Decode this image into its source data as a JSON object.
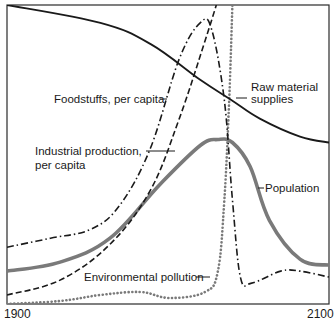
{
  "chart_data": {
    "type": "line",
    "title": "",
    "xlabel": "",
    "ylabel": "",
    "xlim": [
      1900,
      2100
    ],
    "ylim": [
      0,
      100
    ],
    "x_tick_labels": [
      "1900",
      "2100"
    ],
    "grid": false,
    "legend_position": "inline labels",
    "series": [
      {
        "name": "Raw material supplies",
        "style": "solid",
        "color": "#1a1a1a",
        "points": [
          [
            1900,
            100
          ],
          [
            1958,
            94
          ],
          [
            1989,
            87
          ],
          [
            2020,
            75
          ],
          [
            2040,
            68
          ],
          [
            2057,
            62
          ],
          [
            2082,
            56
          ],
          [
            2100,
            54
          ]
        ]
      },
      {
        "name": "Population",
        "style": "thick-solid",
        "color": "#7a7a7a",
        "points": [
          [
            1900,
            11
          ],
          [
            1933,
            14
          ],
          [
            1964,
            22
          ],
          [
            1995,
            40
          ],
          [
            2020,
            53
          ],
          [
            2031,
            55
          ],
          [
            2040,
            54
          ],
          [
            2051,
            46
          ],
          [
            2063,
            28
          ],
          [
            2082,
            15
          ],
          [
            2100,
            13
          ]
        ]
      },
      {
        "name": "Industrial production, per capita",
        "style": "dashed",
        "color": "#1a1a1a",
        "points": [
          [
            1900,
            3
          ],
          [
            1933,
            8
          ],
          [
            1964,
            20
          ],
          [
            1989,
            38
          ],
          [
            2007,
            62
          ],
          [
            2023,
            88
          ],
          [
            2030,
            100
          ]
        ]
      },
      {
        "name": "Foodstuffs, per capita",
        "style": "dash-dot",
        "color": "#1a1a1a",
        "points": [
          [
            1900,
            19
          ],
          [
            1927,
            22
          ],
          [
            1952,
            25
          ],
          [
            1970,
            33
          ],
          [
            1989,
            52
          ],
          [
            2007,
            82
          ],
          [
            2020,
            94
          ],
          [
            2027,
            92
          ],
          [
            2035,
            68
          ],
          [
            2040,
            35
          ],
          [
            2045,
            9
          ],
          [
            2052,
            7
          ],
          [
            2070,
            11
          ],
          [
            2082,
            11
          ],
          [
            2100,
            9
          ]
        ]
      },
      {
        "name": "Environmental pollution",
        "style": "dotted",
        "color": "#7a7a7a",
        "points": [
          [
            1900,
            0
          ],
          [
            1933,
            1
          ],
          [
            1958,
            3
          ],
          [
            1983,
            4
          ],
          [
            2001,
            2
          ],
          [
            2023,
            4
          ],
          [
            2031,
            11
          ],
          [
            2035,
            35
          ],
          [
            2038,
            68
          ],
          [
            2040,
            100
          ]
        ]
      }
    ],
    "annotations": [
      "Foodstuffs, per capita",
      "Industrial production, per capita",
      "Raw material supplies",
      "Population",
      "Environmental pollution"
    ]
  },
  "labels": {
    "food": "Foodstuffs, per capita",
    "industrial_line1": "Industrial production,",
    "industrial_line2": "per capita",
    "raw_line1": "Raw material",
    "raw_line2": "supplies",
    "population": "Population",
    "pollution": "Environmental pollution",
    "x_start": "1900",
    "x_end": "2100"
  }
}
